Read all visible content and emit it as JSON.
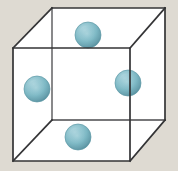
{
  "figure": {
    "background_color": "#dedad2",
    "canvas": {
      "width": 178,
      "height": 171
    }
  },
  "cube": {
    "name": "unit-cell-cube",
    "edge_color": "#38383a",
    "edge_width": 1.6,
    "face_fill": "#ffffff",
    "projection": "oblique-cavalier",
    "offset": {
      "dx": 39,
      "dy": -40
    },
    "front_face": {
      "label": "front-face",
      "top_left": [
        13,
        48
      ],
      "top_right": [
        130,
        48
      ],
      "bottom_right": [
        130,
        161
      ],
      "bottom_left": [
        13,
        161
      ]
    },
    "back_face": {
      "label": "back-face",
      "top_left": [
        52,
        8
      ],
      "top_right": [
        165,
        8
      ],
      "bottom_right": [
        165,
        120
      ],
      "bottom_left": [
        52,
        120
      ]
    },
    "connecting_edges": [
      {
        "label": "edge-top-left",
        "from": [
          13,
          48
        ],
        "to": [
          52,
          8
        ]
      },
      {
        "label": "edge-top-right",
        "from": [
          130,
          48
        ],
        "to": [
          165,
          8
        ]
      },
      {
        "label": "edge-bottom-right",
        "from": [
          130,
          161
        ],
        "to": [
          165,
          120
        ]
      },
      {
        "label": "edge-bottom-left",
        "from": [
          13,
          161
        ],
        "to": [
          52,
          120
        ]
      }
    ]
  },
  "spheres": {
    "count": 4,
    "radius": 13,
    "base_color": "#7ab6c2",
    "highlight_color": "#b9dbe2",
    "shadow_color": "#4d8e9c",
    "outline_color": "#5f9aa6",
    "items": [
      {
        "label": "sphere-top",
        "position": "top-face-centre",
        "cx": 88,
        "cy": 35,
        "r": 13
      },
      {
        "label": "sphere-left",
        "position": "left-face-centre",
        "cx": 37,
        "cy": 89,
        "r": 13
      },
      {
        "label": "sphere-right",
        "position": "right-face-centre",
        "cx": 128,
        "cy": 83,
        "r": 13
      },
      {
        "label": "sphere-bottom",
        "position": "bottom-face-centre",
        "cx": 78,
        "cy": 137,
        "r": 13
      }
    ]
  }
}
